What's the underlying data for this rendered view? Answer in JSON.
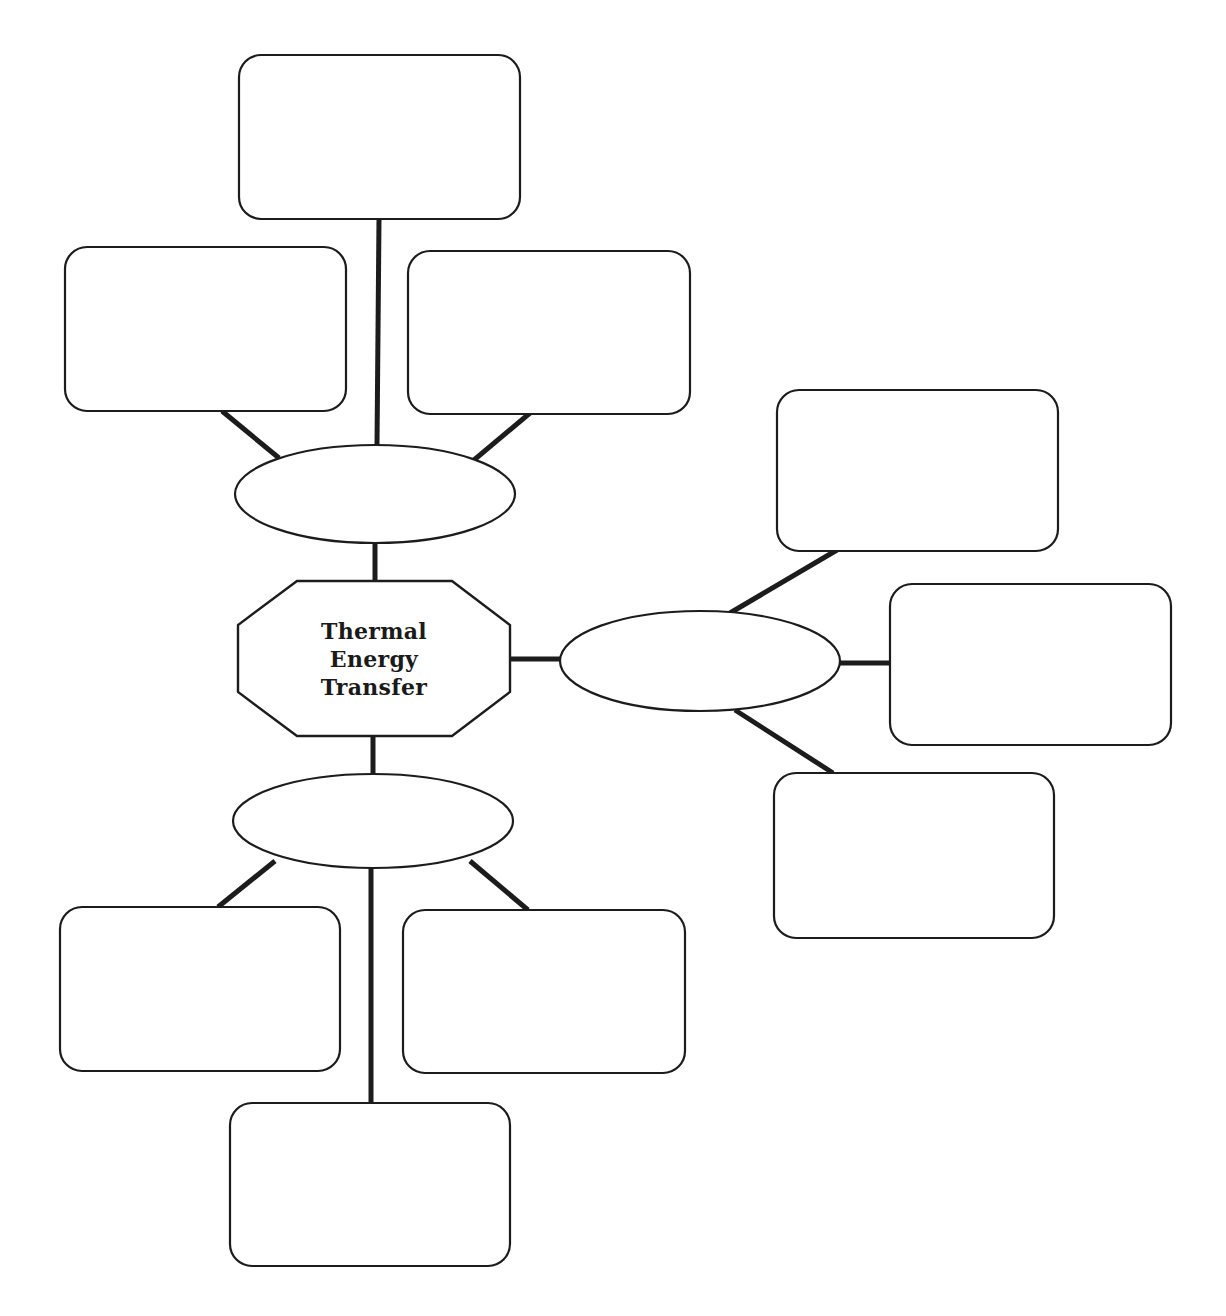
{
  "diagram": {
    "title_lines": [
      "Thermal",
      "Energy",
      "Transfer"
    ],
    "stroke_color": "#1c1c1c",
    "background": "#ffffff",
    "center_node": {
      "shape": "octagon",
      "points": "297,581 452,581 510,625 510,692 452,736 297,736 238,692 238,625"
    },
    "branch_nodes": [
      {
        "id": "top",
        "shape": "ellipse",
        "cx": 375,
        "cy": 494,
        "rx": 140,
        "ry": 49,
        "label": ""
      },
      {
        "id": "right",
        "shape": "ellipse",
        "cx": 700,
        "cy": 661,
        "rx": 140,
        "ry": 50,
        "label": ""
      },
      {
        "id": "bottom",
        "shape": "ellipse",
        "cx": 373,
        "cy": 821,
        "rx": 140,
        "ry": 47,
        "label": ""
      }
    ],
    "leaf_boxes": [
      {
        "id": "top-top",
        "x": 239,
        "y": 55,
        "w": 281,
        "h": 164,
        "label": ""
      },
      {
        "id": "top-left",
        "x": 65,
        "y": 247,
        "w": 281,
        "h": 164,
        "label": ""
      },
      {
        "id": "top-right",
        "x": 408,
        "y": 251,
        "w": 282,
        "h": 163,
        "label": ""
      },
      {
        "id": "right-top",
        "x": 777,
        "y": 390,
        "w": 281,
        "h": 161,
        "label": ""
      },
      {
        "id": "right-middle",
        "x": 890,
        "y": 584,
        "w": 281,
        "h": 161,
        "label": ""
      },
      {
        "id": "right-bottom",
        "x": 774,
        "y": 773,
        "w": 280,
        "h": 165,
        "label": ""
      },
      {
        "id": "bottom-left",
        "x": 60,
        "y": 907,
        "w": 280,
        "h": 164,
        "label": ""
      },
      {
        "id": "bottom-right",
        "x": 403,
        "y": 910,
        "w": 282,
        "h": 163,
        "label": ""
      },
      {
        "id": "bottom-bottom",
        "x": 230,
        "y": 1103,
        "w": 280,
        "h": 163,
        "label": ""
      }
    ],
    "connectors": [
      {
        "x1": 379,
        "y1": 219,
        "x2": 377,
        "y2": 445
      },
      {
        "x1": 222,
        "y1": 411,
        "x2": 279,
        "y2": 458
      },
      {
        "x1": 530,
        "y1": 413,
        "x2": 474,
        "y2": 460
      },
      {
        "x1": 375,
        "y1": 543,
        "x2": 375,
        "y2": 581
      },
      {
        "x1": 510,
        "y1": 659,
        "x2": 561,
        "y2": 659
      },
      {
        "x1": 837,
        "y1": 550,
        "x2": 730,
        "y2": 613
      },
      {
        "x1": 840,
        "y1": 663,
        "x2": 890,
        "y2": 663
      },
      {
        "x1": 735,
        "y1": 710,
        "x2": 833,
        "y2": 773
      },
      {
        "x1": 373,
        "y1": 736,
        "x2": 373,
        "y2": 774
      },
      {
        "x1": 275,
        "y1": 861,
        "x2": 218,
        "y2": 907
      },
      {
        "x1": 470,
        "y1": 861,
        "x2": 528,
        "y2": 910
      },
      {
        "x1": 371,
        "y1": 868,
        "x2": 371,
        "y2": 1103
      }
    ]
  }
}
